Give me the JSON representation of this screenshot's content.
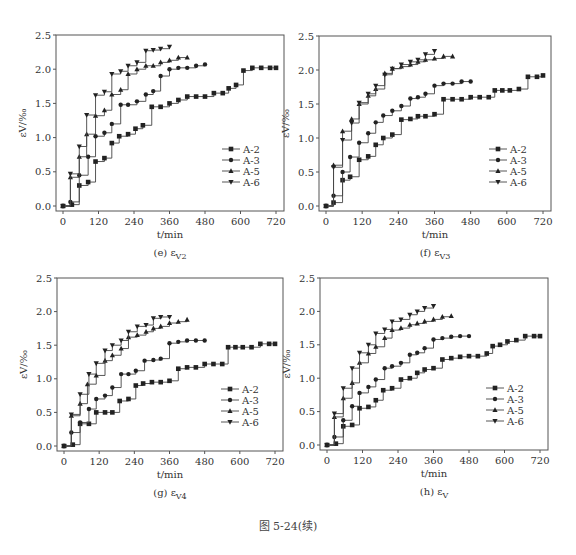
{
  "figure": {
    "caption": "图 5-24(续)"
  },
  "chart_data": [
    {
      "id": "e",
      "type": "line",
      "step": true,
      "subtitle": "(e)  εV2",
      "subtitle_prefix": "(e)",
      "subtitle_symbol": "ε",
      "subtitle_sub": "V2",
      "xlabel": "t/min",
      "ylabel": "εV/‰",
      "xlim": [
        0,
        720
      ],
      "ylim": [
        0,
        2.5
      ],
      "xticks": [
        0,
        120,
        240,
        360,
        480,
        600,
        720
      ],
      "yticks": [
        0.0,
        0.5,
        1.0,
        1.5,
        2.0,
        2.5
      ],
      "legend": [
        "A-2",
        "A-3",
        "A-5",
        "A-6"
      ],
      "legend_position": "lower right",
      "box": {
        "left": 56,
        "top": 35,
        "right": 284,
        "bottom": 211
      },
      "series": [
        {
          "name": "A-2",
          "marker": "square",
          "x": [
            0,
            30,
            55,
            85,
            110,
            140,
            165,
            190,
            220,
            245,
            270,
            300,
            330,
            360,
            390,
            420,
            450,
            480,
            510,
            540,
            560,
            585,
            610,
            640,
            670,
            700,
            720
          ],
          "y": [
            0,
            0.02,
            0.3,
            0.35,
            0.65,
            0.7,
            0.92,
            1.02,
            1.05,
            1.13,
            1.18,
            1.45,
            1.45,
            1.5,
            1.55,
            1.6,
            1.6,
            1.6,
            1.65,
            1.65,
            1.72,
            1.77,
            1.98,
            2.02,
            2.02,
            2.02,
            2.02
          ]
        },
        {
          "name": "A-3",
          "marker": "circle",
          "x": [
            0,
            25,
            55,
            85,
            110,
            140,
            165,
            195,
            220,
            250,
            280,
            305,
            330,
            360,
            390,
            420,
            450,
            480
          ],
          "y": [
            0,
            0.06,
            0.45,
            0.72,
            1.02,
            1.07,
            1.2,
            1.48,
            1.48,
            1.53,
            1.63,
            1.68,
            1.9,
            2.0,
            2.02,
            2.02,
            2.05,
            2.07
          ]
        },
        {
          "name": "A-5",
          "marker": "triangle-up",
          "x": [
            0,
            25,
            55,
            80,
            110,
            140,
            165,
            195,
            220,
            250,
            280,
            305,
            330,
            360,
            390,
            420
          ],
          "y": [
            0,
            0.42,
            0.72,
            1.05,
            1.32,
            1.4,
            1.63,
            1.7,
            1.93,
            2.0,
            2.05,
            2.05,
            2.1,
            2.13,
            2.17,
            2.17
          ]
        },
        {
          "name": "A-6",
          "marker": "triangle-down",
          "x": [
            0,
            25,
            55,
            80,
            110,
            140,
            165,
            195,
            220,
            250,
            280,
            305,
            330,
            360
          ],
          "y": [
            0,
            0.47,
            0.87,
            1.33,
            1.62,
            1.67,
            1.93,
            1.97,
            2.05,
            2.1,
            2.27,
            2.28,
            2.3,
            2.33
          ]
        }
      ]
    },
    {
      "id": "f",
      "type": "line",
      "step": true,
      "subtitle": "(f)  εV3",
      "subtitle_prefix": "(f)",
      "subtitle_symbol": "ε",
      "subtitle_sub": "V3",
      "xlabel": "t/min",
      "ylabel": "εV/‰",
      "xlim": [
        0,
        720
      ],
      "ylim": [
        0,
        2.5
      ],
      "xticks": [
        0,
        120,
        240,
        360,
        480,
        600,
        720
      ],
      "yticks": [
        0.0,
        0.5,
        1.0,
        1.5,
        2.0,
        2.5
      ],
      "legend": [
        "A-2",
        "A-3",
        "A-5",
        "A-6"
      ],
      "legend_position": "lower right",
      "box": {
        "left": 319,
        "top": 36,
        "right": 551,
        "bottom": 211
      },
      "series": [
        {
          "name": "A-2",
          "marker": "square",
          "x": [
            0,
            25,
            55,
            80,
            110,
            140,
            165,
            190,
            220,
            250,
            280,
            305,
            330,
            360,
            390,
            420,
            450,
            480,
            510,
            540,
            560,
            585,
            610,
            640,
            670,
            700,
            720
          ],
          "y": [
            0,
            0.05,
            0.38,
            0.43,
            0.68,
            0.73,
            0.9,
            1.0,
            1.05,
            1.27,
            1.28,
            1.32,
            1.32,
            1.35,
            1.57,
            1.57,
            1.57,
            1.6,
            1.6,
            1.6,
            1.7,
            1.7,
            1.7,
            1.72,
            1.9,
            1.9,
            1.92
          ]
        },
        {
          "name": "A-3",
          "marker": "circle",
          "x": [
            0,
            25,
            55,
            80,
            110,
            140,
            165,
            190,
            220,
            250,
            280,
            305,
            330,
            360,
            390,
            420,
            450,
            480
          ],
          "y": [
            0,
            0.15,
            0.5,
            0.72,
            0.93,
            1.07,
            1.23,
            1.33,
            1.4,
            1.47,
            1.58,
            1.6,
            1.65,
            1.77,
            1.8,
            1.8,
            1.83,
            1.83
          ]
        },
        {
          "name": "A-5",
          "marker": "triangle-up",
          "x": [
            0,
            25,
            55,
            85,
            110,
            140,
            165,
            195,
            220,
            250,
            280,
            305,
            330,
            360,
            390,
            420
          ],
          "y": [
            0,
            0.6,
            1.1,
            1.28,
            1.5,
            1.62,
            1.72,
            1.95,
            2.02,
            2.05,
            2.08,
            2.12,
            2.15,
            2.17,
            2.2,
            2.2
          ]
        },
        {
          "name": "A-6",
          "marker": "triangle-down",
          "x": [
            0,
            25,
            55,
            85,
            110,
            140,
            165,
            195,
            220,
            250,
            280,
            305,
            330,
            360
          ],
          "y": [
            0,
            0.57,
            0.97,
            1.22,
            1.52,
            1.65,
            1.77,
            1.93,
            2.02,
            2.08,
            2.12,
            2.15,
            2.23,
            2.28
          ]
        }
      ]
    },
    {
      "id": "g",
      "type": "line",
      "step": true,
      "subtitle": "(g)  εV4",
      "subtitle_prefix": "(g)",
      "subtitle_symbol": "ε",
      "subtitle_sub": "V4",
      "xlabel": "t/min",
      "ylabel": "εV/‰",
      "xlim": [
        0,
        720
      ],
      "ylim": [
        0,
        2.5
      ],
      "xticks": [
        0,
        120,
        240,
        360,
        480,
        600,
        720
      ],
      "yticks": [
        0.0,
        0.5,
        1.0,
        1.5,
        2.0,
        2.5
      ],
      "legend": [
        "A-2",
        "A-3",
        "A-5",
        "A-6"
      ],
      "legend_position": "lower right",
      "box": {
        "left": 57,
        "top": 278,
        "right": 283,
        "bottom": 451
      },
      "series": [
        {
          "name": "A-2",
          "marker": "square",
          "x": [
            0,
            30,
            55,
            85,
            110,
            140,
            165,
            190,
            220,
            245,
            270,
            300,
            330,
            360,
            390,
            420,
            450,
            480,
            510,
            540,
            560,
            585,
            610,
            640,
            670,
            700,
            720
          ],
          "y": [
            0,
            0.02,
            0.33,
            0.33,
            0.5,
            0.5,
            0.5,
            0.67,
            0.7,
            0.9,
            0.93,
            0.95,
            0.95,
            0.97,
            1.15,
            1.17,
            1.17,
            1.22,
            1.22,
            1.22,
            1.47,
            1.47,
            1.47,
            1.47,
            1.52,
            1.52,
            1.52
          ]
        },
        {
          "name": "A-3",
          "marker": "circle",
          "x": [
            0,
            25,
            55,
            85,
            110,
            140,
            165,
            195,
            220,
            245,
            275,
            305,
            330,
            360,
            390,
            420,
            450,
            480
          ],
          "y": [
            0,
            0.2,
            0.35,
            0.55,
            0.7,
            0.75,
            0.87,
            1.07,
            1.07,
            1.12,
            1.27,
            1.28,
            1.3,
            1.53,
            1.55,
            1.57,
            1.57,
            1.57
          ]
        },
        {
          "name": "A-5",
          "marker": "triangle-up",
          "x": [
            0,
            25,
            55,
            80,
            110,
            140,
            165,
            195,
            220,
            250,
            280,
            305,
            330,
            360,
            390,
            420
          ],
          "y": [
            0,
            0.45,
            0.63,
            0.92,
            1.05,
            1.27,
            1.35,
            1.45,
            1.62,
            1.65,
            1.7,
            1.75,
            1.78,
            1.83,
            1.85,
            1.88
          ]
        },
        {
          "name": "A-6",
          "marker": "triangle-down",
          "x": [
            0,
            25,
            55,
            85,
            110,
            140,
            165,
            195,
            220,
            250,
            280,
            305,
            330,
            360
          ],
          "y": [
            0,
            0.47,
            0.77,
            1.07,
            1.23,
            1.42,
            1.5,
            1.57,
            1.7,
            1.78,
            1.8,
            1.9,
            1.92,
            1.92
          ]
        }
      ]
    },
    {
      "id": "h",
      "type": "line",
      "step": true,
      "subtitle": "(h)  εV",
      "subtitle_prefix": "(h)",
      "subtitle_symbol": "ε",
      "subtitle_sub": "V",
      "xlabel": "t/min",
      "ylabel": "εV/‰",
      "xlim": [
        0,
        720
      ],
      "ylim": [
        0,
        2.5
      ],
      "xticks": [
        0,
        120,
        240,
        360,
        480,
        600,
        720
      ],
      "yticks": [
        0.0,
        0.5,
        1.0,
        1.5,
        2.0,
        2.5
      ],
      "legend": [
        "A-2",
        "A-3",
        "A-5",
        "A-6"
      ],
      "legend_position": "lower right",
      "box": {
        "left": 320,
        "top": 278,
        "right": 548,
        "bottom": 450
      },
      "series": [
        {
          "name": "A-2",
          "marker": "square",
          "x": [
            0,
            30,
            55,
            85,
            110,
            140,
            165,
            190,
            220,
            250,
            280,
            305,
            330,
            360,
            390,
            420,
            450,
            480,
            510,
            540,
            560,
            585,
            610,
            640,
            670,
            700,
            720
          ],
          "y": [
            0,
            0.02,
            0.28,
            0.3,
            0.55,
            0.57,
            0.67,
            0.82,
            0.85,
            0.98,
            1.0,
            1.08,
            1.13,
            1.15,
            1.28,
            1.3,
            1.32,
            1.33,
            1.33,
            1.37,
            1.48,
            1.5,
            1.55,
            1.57,
            1.63,
            1.63,
            1.63
          ]
        },
        {
          "name": "A-3",
          "marker": "circle",
          "x": [
            0,
            25,
            55,
            85,
            110,
            140,
            165,
            195,
            220,
            250,
            280,
            305,
            330,
            360,
            390,
            420,
            450,
            480
          ],
          "y": [
            0,
            0.12,
            0.37,
            0.58,
            0.78,
            0.87,
            0.98,
            1.15,
            1.18,
            1.23,
            1.35,
            1.38,
            1.45,
            1.58,
            1.6,
            1.62,
            1.63,
            1.63
          ]
        },
        {
          "name": "A-5",
          "marker": "triangle-up",
          "x": [
            0,
            25,
            55,
            85,
            110,
            140,
            165,
            195,
            220,
            250,
            280,
            305,
            330,
            360,
            390,
            420
          ],
          "y": [
            0,
            0.42,
            0.7,
            0.93,
            1.23,
            1.37,
            1.47,
            1.6,
            1.72,
            1.75,
            1.8,
            1.82,
            1.85,
            1.88,
            1.92,
            1.93
          ]
        },
        {
          "name": "A-6",
          "marker": "triangle-down",
          "x": [
            0,
            25,
            55,
            85,
            110,
            140,
            165,
            195,
            220,
            250,
            280,
            305,
            330,
            360
          ],
          "y": [
            0,
            0.47,
            0.85,
            1.15,
            1.38,
            1.5,
            1.67,
            1.73,
            1.85,
            1.88,
            1.95,
            2.0,
            2.05,
            2.08
          ]
        }
      ]
    }
  ]
}
